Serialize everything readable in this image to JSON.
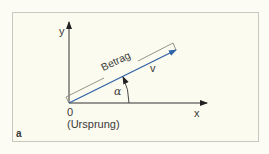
{
  "figure": {
    "panel_label": "a",
    "axes": {
      "x_label": "x",
      "y_label": "y",
      "origin_label": "0",
      "origin_caption": "(Ursprung)"
    },
    "vector": {
      "label": "v",
      "magnitude_label": "Betrag",
      "angle_label": "α",
      "color": "#2f63a8"
    },
    "colors": {
      "background": "#fcfbef",
      "frame_border": "#c9c8c0",
      "axis": "#333333",
      "bracket": "#8a8a7a"
    }
  }
}
